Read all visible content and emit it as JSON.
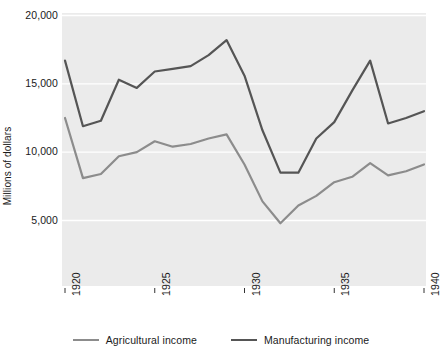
{
  "chart_data": {
    "type": "line",
    "title": "",
    "xlabel": "",
    "ylabel": "Millions of dollars",
    "x": [
      1920,
      1921,
      1922,
      1923,
      1924,
      1925,
      1926,
      1927,
      1928,
      1929,
      1930,
      1931,
      1932,
      1933,
      1934,
      1935,
      1936,
      1937,
      1938,
      1939,
      1940
    ],
    "xlim": [
      1920,
      1940
    ],
    "ylim": [
      0,
      20000
    ],
    "xticks": [
      1920,
      1925,
      1930,
      1935,
      1940
    ],
    "xtick_labels": [
      "1920",
      "1925",
      "1930",
      "1935",
      "1940"
    ],
    "yticks": [
      5000,
      10000,
      15000,
      20000
    ],
    "ytick_labels": [
      "5,000",
      "10,000",
      "15,000",
      "20,000"
    ],
    "grid": "horizontal-white-gridlines-on-gray-panel",
    "legend_position": "bottom-center",
    "series": [
      {
        "name": "Agricultural income",
        "color": "#8c8c8c",
        "values": [
          12500,
          8100,
          8400,
          9700,
          10000,
          10800,
          10400,
          10600,
          11000,
          11300,
          9100,
          6400,
          4800,
          6100,
          6800,
          7800,
          8200,
          9200,
          8300,
          8600,
          9100
        ]
      },
      {
        "name": "Manufacturing income",
        "color": "#555555",
        "values": [
          16700,
          11900,
          12300,
          15300,
          14700,
          15900,
          16100,
          16300,
          17100,
          18200,
          15600,
          11600,
          8500,
          8500,
          11000,
          12200,
          14500,
          16700,
          12100,
          12500,
          13000
        ]
      }
    ]
  },
  "colors": {
    "panel_background": "#ebebeb",
    "gridline": "#ffffff",
    "text": "#1a1a1a",
    "figure_background": "#ffffff"
  },
  "axis": {
    "y_title": "Millions of dollars"
  },
  "legend": {
    "items": [
      {
        "label": "Agricultural income",
        "color": "#8c8c8c"
      },
      {
        "label": "Manufacturing income",
        "color": "#555555"
      }
    ]
  }
}
